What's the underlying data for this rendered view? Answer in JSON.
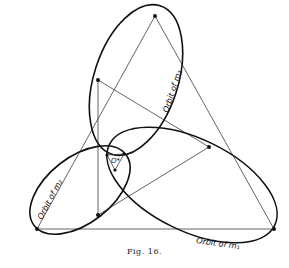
{
  "figure": {
    "caption": "Fig. 16.",
    "labels": {
      "orbit_m1": "Orbit of m₁",
      "orbit_m2": "Orbit of m₂",
      "orbit_m3": "Orbit of m₃",
      "center": "O*"
    },
    "colors": {
      "ink": "#111111",
      "background": "#ffffff"
    }
  }
}
